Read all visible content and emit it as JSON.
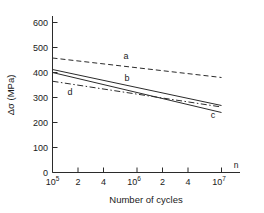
{
  "chart_data": {
    "type": "line",
    "title": "",
    "xlabel": "Number of cycles",
    "ylabel": "Δσ (MPa)",
    "xscale": "log",
    "xlim": [
      100000,
      10000000
    ],
    "ylim": [
      0,
      650
    ],
    "grid": false,
    "legend_position": "inline-labels",
    "x_tick_labels": [
      "10⁵",
      "2",
      "4",
      "10⁶",
      "2",
      "4",
      "10⁷"
    ],
    "x_tick_values": [
      100000,
      200000,
      400000,
      1000000,
      2000000,
      4000000,
      10000000
    ],
    "y_tick_labels": [
      "0",
      "100",
      "200",
      "300",
      "400",
      "500",
      "600"
    ],
    "y_tick_values": [
      0,
      100,
      200,
      300,
      400,
      500,
      600
    ],
    "axis_corner_label": "n",
    "series": [
      {
        "name": "a",
        "style": "dashed",
        "label": "a",
        "x": [
          100000,
          10000000
        ],
        "values": [
          458,
          380
        ]
      },
      {
        "name": "b",
        "style": "solid",
        "label": "b",
        "x": [
          100000,
          10000000
        ],
        "values": [
          412,
          268
        ]
      },
      {
        "name": "c",
        "style": "solid",
        "label": "c",
        "x": [
          100000,
          10000000
        ],
        "values": [
          400,
          240
        ]
      },
      {
        "name": "d",
        "style": "dashdot",
        "label": "d",
        "x": [
          100000,
          10000000
        ],
        "values": [
          365,
          262
        ]
      }
    ]
  },
  "axis_labels": {
    "x_title": "Number of cycles",
    "y_title": "Δσ (MPa)",
    "corner": "n"
  },
  "ticks": {
    "x": [
      "10",
      "2",
      "4",
      "10",
      "2",
      "4",
      "10"
    ],
    "x_exponents": [
      "5",
      "",
      "",
      "6",
      "",
      "",
      "7"
    ],
    "y": [
      "600",
      "500",
      "400",
      "300",
      "200",
      "100",
      "0"
    ]
  },
  "curve_labels": {
    "a": "a",
    "b": "b",
    "c": "c",
    "d": "d"
  },
  "colors": {
    "axis": "#2b2b2b",
    "line": "#2b2b2b",
    "background": "#ffffff"
  }
}
